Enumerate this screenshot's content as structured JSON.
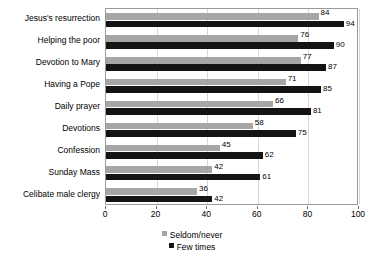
{
  "chart_data": {
    "type": "bar",
    "orientation": "horizontal",
    "title": "",
    "xlabel": "",
    "ylabel": "",
    "xlim": [
      0,
      100
    ],
    "xticks": [
      0,
      20,
      40,
      60,
      80,
      100
    ],
    "grid": true,
    "legend_position": "bottom",
    "categories": [
      "Jesus's resurrection",
      "Helping the poor",
      "Devotion to Mary",
      "Having a Pope",
      "Daily prayer",
      "Devotions",
      "Confession",
      "Sunday Mass",
      "Celibate male clergy"
    ],
    "series": [
      {
        "name": "Seldom/never",
        "color": "#a6a6a6",
        "values": [
          84,
          76,
          77,
          71,
          66,
          58,
          45,
          42,
          36
        ]
      },
      {
        "name": "Few times",
        "color": "#141414",
        "values": [
          94,
          90,
          87,
          85,
          81,
          75,
          62,
          61,
          42
        ]
      }
    ]
  }
}
